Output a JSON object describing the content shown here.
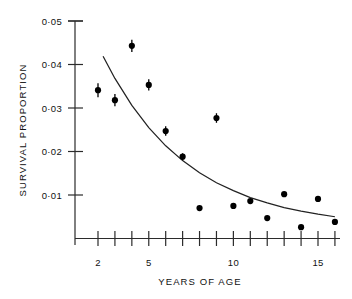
{
  "chart_data": {
    "type": "scatter",
    "title": "",
    "xlabel": "YEARS OF AGE",
    "ylabel": "SURVIVAL PROPORTION",
    "xlim": [
      1.3,
      16.6
    ],
    "ylim": [
      0,
      0.05
    ],
    "grid": false,
    "legend": null,
    "x_ticks": [
      2,
      3,
      4,
      5,
      6,
      7,
      8,
      9,
      10,
      11,
      12,
      13,
      14,
      15,
      16
    ],
    "x_tick_labels": [
      "2",
      "",
      "",
      "5",
      "",
      "",
      "",
      "",
      "10",
      "",
      "",
      "",
      "",
      "15",
      ""
    ],
    "y_ticks": [
      0.01,
      0.02,
      0.03,
      0.04,
      0.05
    ],
    "y_tick_labels": [
      "0·01",
      "0·02",
      "0·03",
      "0·04",
      "0·05"
    ],
    "series": [
      {
        "name": "observed survival proportion",
        "type": "scatter_with_errorbars",
        "x": [
          2,
          3,
          4,
          5,
          6,
          7,
          8,
          9,
          10,
          11,
          12,
          13,
          14,
          15,
          16
        ],
        "values": [
          0.0341,
          0.0318,
          0.0443,
          0.0353,
          0.0247,
          0.0188,
          0.007,
          0.0277,
          0.0075,
          0.0086,
          0.0047,
          0.0102,
          0.0026,
          0.0091,
          0.0038
        ],
        "errors": [
          0.0016,
          0.0014,
          0.0014,
          0.0013,
          0.0011,
          0.0008,
          0.0,
          0.0011,
          0.0,
          0.0,
          0.0,
          0.0,
          0.0,
          0.0,
          0.0
        ]
      },
      {
        "name": "fitted exponential curve",
        "type": "line",
        "x": [
          2.3,
          3.0,
          4.0,
          5.0,
          6.0,
          7.0,
          8.0,
          9.0,
          10.0,
          11.0,
          12.0,
          13.0,
          14.0,
          15.0,
          16.0
        ],
        "values": [
          0.0419,
          0.0368,
          0.0306,
          0.0255,
          0.0213,
          0.0179,
          0.0151,
          0.0128,
          0.011,
          0.0094,
          0.0082,
          0.0071,
          0.0063,
          0.0056,
          0.005
        ]
      }
    ]
  },
  "axes": {
    "y_axis_title": "SURVIVAL PROPORTION",
    "x_axis_title": "YEARS OF AGE"
  }
}
